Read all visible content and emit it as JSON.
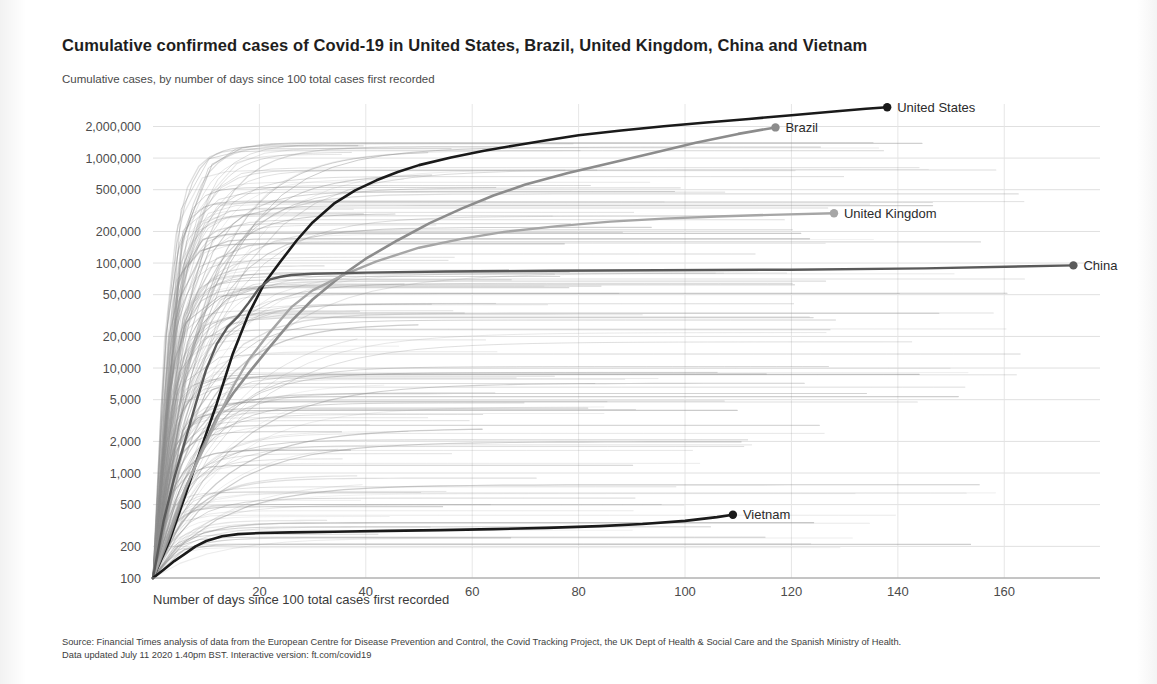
{
  "header": {
    "title": "Cumulative confirmed cases of Covid-19 in United States, Brazil, United Kingdom, China and Vietnam",
    "subtitle": "Cumulative cases, by number of days since 100 total cases first recorded"
  },
  "footer": {
    "line1": "Source: Financial Times analysis of data from the European Centre for Disease Prevention and Control, the Covid Tracking Project, the UK Dept of Health & Social Care and the Spanish Ministry of Health.",
    "line2": "Data updated July 11 2020 1.40pm BST. Interactive version: ft.com/covid19"
  },
  "chart_data": {
    "type": "line",
    "title": "Cumulative confirmed cases of Covid-19 in United States, Brazil, United Kingdom, China and Vietnam",
    "subtitle": "Cumulative cases, by number of days since 100 total cases first recorded",
    "xlabel": "Number of days since 100 total cases first recorded",
    "ylabel": "",
    "yscale": "log",
    "ylim": [
      100,
      3000000
    ],
    "xlim": [
      0,
      178
    ],
    "grid": true,
    "legend_position": "end-of-line-labels",
    "xticks": [
      20,
      40,
      60,
      80,
      100,
      120,
      140,
      160
    ],
    "xtick_labels": [
      "20",
      "40",
      "60",
      "80",
      "100",
      "120",
      "140",
      "160"
    ],
    "yticks": [
      100,
      200,
      500,
      1000,
      2000,
      5000,
      10000,
      20000,
      50000,
      100000,
      200000,
      500000,
      1000000,
      2000000
    ],
    "ytick_labels": [
      "100",
      "200",
      "500",
      "1,000",
      "2,000",
      "5,000",
      "10,000",
      "20,000",
      "50,000",
      "100,000",
      "200,000",
      "500,000",
      "1,000,000",
      "2,000,000"
    ],
    "series": [
      {
        "name": "United States",
        "color": "#1a1a1a",
        "width": 2.6,
        "label_x": 138,
        "label_y": 3150000,
        "x": [
          0,
          3,
          6,
          9,
          12,
          15,
          18,
          21,
          24,
          27,
          30,
          34,
          38,
          42,
          46,
          50,
          56,
          62,
          68,
          74,
          80,
          88,
          96,
          104,
          112,
          120,
          128,
          134,
          138
        ],
        "y": [
          100,
          220,
          600,
          1700,
          4600,
          13700,
          33000,
          65000,
          104000,
          164000,
          244000,
          368000,
          492000,
          614000,
          738000,
          857000,
          1012000,
          1166000,
          1320000,
          1480000,
          1650000,
          1830000,
          2010000,
          2180000,
          2360000,
          2560000,
          2780000,
          2950000,
          3050000
        ]
      },
      {
        "name": "Brazil",
        "color": "#8c8c8c",
        "width": 2.6,
        "label_x": 117,
        "label_y": 1950000,
        "x": [
          0,
          3,
          6,
          9,
          12,
          15,
          18,
          22,
          26,
          30,
          35,
          40,
          46,
          52,
          58,
          64,
          70,
          78,
          86,
          94,
          102,
          110,
          117
        ],
        "y": [
          100,
          240,
          680,
          1600,
          3400,
          5700,
          9000,
          16000,
          28000,
          45000,
          73000,
          110000,
          165000,
          240000,
          330000,
          440000,
          560000,
          720000,
          900000,
          1120000,
          1400000,
          1700000,
          1960000
        ]
      },
      {
        "name": "United Kingdom",
        "color": "#a6a6a6",
        "width": 2.4,
        "label_x": 128,
        "label_y": 300000,
        "x": [
          0,
          3,
          6,
          9,
          12,
          15,
          18,
          22,
          26,
          30,
          36,
          42,
          50,
          58,
          66,
          76,
          86,
          96,
          106,
          116,
          128
        ],
        "y": [
          100,
          270,
          700,
          1500,
          3200,
          6600,
          12000,
          22000,
          38000,
          55000,
          78000,
          104000,
          140000,
          170000,
          198000,
          225000,
          248000,
          265000,
          278000,
          288000,
          298000
        ]
      },
      {
        "name": "China",
        "color": "#5a5a5a",
        "width": 2.4,
        "label_x": 173,
        "label_y": 100000,
        "x": [
          0,
          2,
          4,
          6,
          8,
          10,
          12,
          14,
          16,
          18,
          20,
          22,
          24,
          26,
          30,
          40,
          55,
          75,
          95,
          120,
          145,
          173
        ],
        "y": [
          100,
          350,
          900,
          2000,
          4500,
          9700,
          17000,
          24500,
          31000,
          42000,
          58000,
          70000,
          74000,
          77000,
          79000,
          81000,
          83000,
          84500,
          85500,
          86500,
          89000,
          95000
        ]
      },
      {
        "name": "Vietnam",
        "color": "#1a1a1a",
        "width": 2.6,
        "label_x": 109,
        "label_y": 420,
        "x": [
          0,
          2,
          4,
          6,
          8,
          10,
          13,
          16,
          20,
          26,
          34,
          44,
          54,
          64,
          74,
          84,
          92,
          100,
          106,
          109
        ],
        "y": [
          100,
          120,
          145,
          170,
          200,
          225,
          250,
          262,
          268,
          272,
          276,
          281,
          286,
          292,
          300,
          312,
          327,
          350,
          380,
          400
        ]
      }
    ],
    "background_series_note": "Approximately 180 faint grey country trajectories drawn behind the highlighted series"
  }
}
